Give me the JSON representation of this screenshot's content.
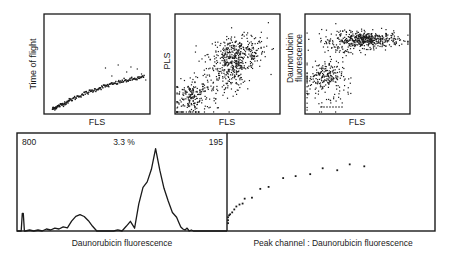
{
  "chart_data": [
    {
      "type": "scatter",
      "panel": "top-left",
      "title": "",
      "xlabel": "FLS",
      "ylabel": "Time of flight",
      "axes_scale": [
        0,
        100
      ],
      "description": "narrow monotonically increasing curve, few outliers above at high FLS",
      "curve": [
        [
          8,
          5
        ],
        [
          12,
          7
        ],
        [
          18,
          10
        ],
        [
          25,
          14
        ],
        [
          35,
          19
        ],
        [
          45,
          23
        ],
        [
          55,
          27
        ],
        [
          65,
          30
        ],
        [
          75,
          33
        ],
        [
          85,
          35
        ],
        [
          95,
          37
        ]
      ],
      "outliers": [
        [
          58,
          46
        ],
        [
          64,
          38
        ],
        [
          70,
          49
        ],
        [
          78,
          42
        ],
        [
          82,
          47
        ],
        [
          88,
          45
        ],
        [
          92,
          40
        ],
        [
          96,
          34
        ]
      ]
    },
    {
      "type": "scatter",
      "panel": "top-middle",
      "title": "",
      "xlabel": "FLS",
      "ylabel": "PLS",
      "axes_scale": [
        0,
        100
      ],
      "clusters": [
        {
          "name": "low cluster",
          "center": [
            15,
            18
          ],
          "spread": [
            8,
            8
          ],
          "n": 150
        },
        {
          "name": "main cluster",
          "center": [
            60,
            60
          ],
          "spread": [
            14,
            8
          ],
          "n": 260
        },
        {
          "name": "mid cluster",
          "center": [
            55,
            42
          ],
          "spread": [
            6,
            10
          ],
          "n": 110
        },
        {
          "name": "diffuse",
          "center": [
            40,
            45
          ],
          "spread": [
            22,
            20
          ],
          "n": 230
        }
      ]
    },
    {
      "type": "scatter",
      "panel": "top-right",
      "title": "",
      "xlabel": "FLS",
      "ylabel": "Daunorubicin fluorescence",
      "axes_scale": [
        0,
        100
      ],
      "clusters": [
        {
          "name": "high fluorescence",
          "center": [
            60,
            74
          ],
          "spread": [
            15,
            4
          ],
          "n": 420
        },
        {
          "name": "high spread",
          "center": [
            35,
            72
          ],
          "spread": [
            12,
            7
          ],
          "n": 90
        },
        {
          "name": "low fluorescence",
          "center": [
            18,
            38
          ],
          "spread": [
            9,
            7
          ],
          "n": 170
        },
        {
          "name": "low diffuse",
          "center": [
            20,
            25
          ],
          "spread": [
            12,
            14
          ],
          "n": 70
        }
      ]
    },
    {
      "type": "line",
      "panel": "bottom-left",
      "title": "",
      "xlabel": "Daunorubicin fluorescence",
      "ylabel": "",
      "annotations": {
        "left": "800",
        "center": "3.3 %",
        "right": "195"
      },
      "xlim": [
        0,
        100
      ],
      "ylim": [
        0,
        100
      ],
      "x": [
        0,
        2,
        2.5,
        3,
        3.5,
        4,
        6,
        8,
        10,
        12,
        14,
        16,
        18,
        20,
        22,
        24,
        26,
        28,
        30,
        32,
        34,
        36,
        38,
        40,
        42,
        44,
        46,
        48,
        50,
        52,
        54,
        56,
        58,
        60,
        62,
        64,
        66,
        68,
        70,
        72,
        74,
        76,
        77,
        78,
        79,
        80,
        81,
        82,
        83,
        84,
        85,
        86,
        87,
        88,
        89,
        90,
        92,
        94,
        96,
        98,
        100
      ],
      "y": [
        0,
        0,
        18,
        18,
        0,
        0,
        1,
        0,
        1,
        0,
        2,
        1,
        3,
        2,
        5,
        4,
        10,
        14,
        17,
        14,
        11,
        6,
        1,
        0,
        1,
        0,
        0,
        1,
        0,
        5,
        9,
        4,
        28,
        45,
        49,
        63,
        84,
        62,
        45,
        32,
        18,
        14,
        9,
        4,
        2,
        1,
        3,
        0,
        1,
        0,
        0,
        0,
        0,
        0,
        0,
        0,
        0,
        0,
        0,
        0,
        0
      ],
      "peak_note": "dominant peak near 62% of axis, height ~83% of panel"
    },
    {
      "type": "scatter",
      "panel": "bottom-right",
      "title": "",
      "xlabel": "Peak channel : Daunorubicin fluorescence",
      "ylabel": "",
      "xlim": [
        0,
        100
      ],
      "ylim": [
        0,
        100
      ],
      "points": [
        [
          0.5,
          8
        ],
        [
          0.5,
          11
        ],
        [
          0.5,
          14
        ],
        [
          1,
          16
        ],
        [
          1.5,
          17
        ],
        [
          2.5,
          19
        ],
        [
          3.5,
          22
        ],
        [
          4.5,
          25
        ],
        [
          6,
          27
        ],
        [
          7.5,
          28
        ],
        [
          8.5,
          33
        ],
        [
          12,
          34
        ],
        [
          16,
          43
        ],
        [
          20,
          45
        ],
        [
          27,
          54
        ],
        [
          33,
          56
        ],
        [
          40,
          58
        ],
        [
          46,
          64
        ],
        [
          53,
          62
        ],
        [
          59,
          68
        ],
        [
          66,
          66
        ]
      ]
    }
  ],
  "labels": {
    "panel1_x": "FLS",
    "panel1_y": "Time of flight",
    "panel2_x": "FLS",
    "panel2_y": "PLS",
    "panel3_x": "FLS",
    "panel3_y_line1": "Daunorubicin",
    "panel3_y_line2": "fluorescence",
    "hist_left": "800",
    "hist_center": "3.3 %",
    "hist_right": "195",
    "hist_x": "Daunorubicin fluorescence",
    "peak_x": "Peak channel : Daunorubicin fluorescence"
  },
  "colors": {
    "ink": "#1a1a1a",
    "background": "#ffffff"
  }
}
